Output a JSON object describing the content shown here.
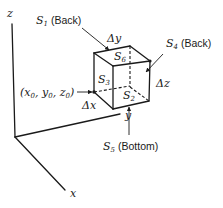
{
  "figure": {
    "type": "3d-control-volume-diagram",
    "axes": {
      "x_label": "x",
      "y_label": "y",
      "z_label": "z"
    },
    "origin_label": "(x0, y0, z0)",
    "origin_label_parts": {
      "open": "(",
      "x": "x",
      "x_sub": "0",
      "y": "y",
      "y_sub": "0",
      "z": "z",
      "z_sub": "0",
      "close": ")",
      "sep": ", "
    },
    "dimensions": {
      "dx": "Δx",
      "dy": "Δy",
      "dz": "Δz"
    },
    "surfaces": [
      {
        "id": "S1",
        "symbol": "S",
        "sub": "1",
        "note": "(Back)"
      },
      {
        "id": "S2",
        "symbol": "S",
        "sub": "2",
        "note": ""
      },
      {
        "id": "S3",
        "symbol": "S",
        "sub": "3",
        "note": ""
      },
      {
        "id": "S4",
        "symbol": "S",
        "sub": "4",
        "note": "(Back)"
      },
      {
        "id": "S5",
        "symbol": "S",
        "sub": "5",
        "note": "(Bottom)"
      },
      {
        "id": "S6",
        "symbol": "S",
        "sub": "6",
        "note": ""
      }
    ]
  }
}
